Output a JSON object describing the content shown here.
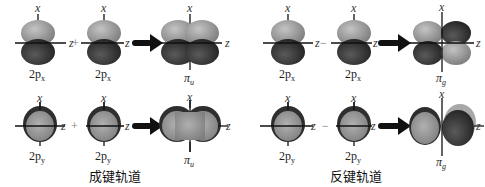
{
  "colors": {
    "lobe_light": "#9a9a9a",
    "lobe_dark": "#3a3a3a",
    "rim": "#2a2a2a",
    "axis": "#111111",
    "arrow": "#111111",
    "background": "#ffffff"
  },
  "axis_labels": {
    "x": "x",
    "z": "z"
  },
  "bonding": {
    "caption": "成键轨道",
    "row_px": {
      "left_label": "2p",
      "left_sub": "x",
      "operator": "+",
      "right_label": "2p",
      "right_sub": "x",
      "result_label": "π",
      "result_sub": "u"
    },
    "row_py": {
      "left_label": "2p",
      "left_sub": "y",
      "operator": "+",
      "right_label": "2p",
      "right_sub": "y",
      "result_label": "π",
      "result_sub": "u"
    }
  },
  "antibonding": {
    "caption": "反键轨道",
    "row_px": {
      "left_label": "2p",
      "left_sub": "x",
      "operator": "−",
      "right_label": "2p",
      "right_sub": "x",
      "result_label": "π",
      "result_sub": "g"
    },
    "row_py": {
      "left_label": "2p",
      "left_sub": "y",
      "operator": "−",
      "right_label": "2p",
      "right_sub": "y",
      "result_label": "π",
      "result_sub": "g"
    }
  }
}
